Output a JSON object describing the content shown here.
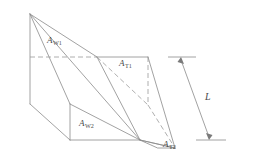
{
  "figure": {
    "background_color": "#ffffff",
    "line_color": "#8a8a8a",
    "hidden_line_color": "#9a9a9a",
    "label_color": "#4a4a4a"
  },
  "labels": {
    "wall_area_1": {
      "symbol": "A",
      "subscript": "W1",
      "meaning": "upper wall face area"
    },
    "wall_area_2": {
      "symbol": "A",
      "subscript": "W2",
      "meaning": "lower wall face area"
    },
    "top_area_1": {
      "symbol": "A",
      "subscript": "T1",
      "meaning": "upper transverse face area"
    },
    "top_area_2": {
      "symbol": "A",
      "subscript": "T2",
      "meaning": "lower transverse face area"
    },
    "length": {
      "symbol": "L",
      "subscript": "",
      "meaning": "overall length dimension"
    }
  },
  "geometry": {
    "apex": [
      30,
      14
    ],
    "left_upper": [
      30,
      57
    ],
    "left_lower": [
      30,
      104
    ],
    "mid_upper": [
      97,
      57
    ],
    "mid_lower": [
      70,
      104
    ],
    "right_upper": [
      148,
      57
    ],
    "right_mid": [
      148,
      105
    ],
    "bottom_left": [
      70,
      140
    ],
    "bottom_mid": [
      140,
      140
    ],
    "bottom_right": [
      175,
      148
    ],
    "dimension_top": [
      180,
      57
    ],
    "dimension_bottom": [
      210,
      140
    ]
  }
}
